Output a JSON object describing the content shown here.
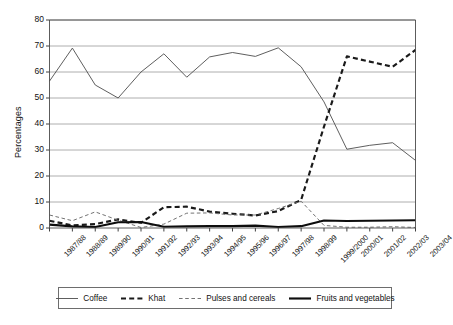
{
  "chart": {
    "type": "line",
    "ylabel": "Percentages",
    "xlabel": ""
  },
  "axis": {
    "yticks": [
      "0",
      "10",
      "20",
      "30",
      "40",
      "50",
      "60",
      "70",
      "80"
    ],
    "ymin": 0,
    "ymax": 80,
    "ystep": 10
  },
  "legend": {
    "items": [
      {
        "label": "Coffee",
        "style": "thin-solid"
      },
      {
        "label": "Khat",
        "style": "thick-dashed"
      },
      {
        "label": "Pulses and cereals",
        "style": "thin-dashed"
      },
      {
        "label": "Fruits and vegetables",
        "style": "thick-solid"
      }
    ]
  },
  "chart_data": {
    "type": "line",
    "title": "",
    "xlabel": "",
    "ylabel": "Percentages",
    "ylim": [
      0,
      80
    ],
    "yticks": [
      0,
      10,
      20,
      30,
      40,
      50,
      60,
      70,
      80
    ],
    "grid": true,
    "legend_position": "bottom",
    "categories": [
      "1987/88",
      "1988/89",
      "1989/90",
      "1990/91",
      "1991/92",
      "1992/93",
      "1993/94",
      "1994/95",
      "1995/96",
      "1996/97",
      "1997/98",
      "1998/99",
      "1999/2000",
      "2000/01",
      "2001/02",
      "2002/03",
      "2003/04"
    ],
    "series": [
      {
        "name": "Coffee",
        "style": "thin-solid",
        "color": "#555555",
        "values": [
          56.5,
          69.2,
          55.0,
          50.0,
          60.0,
          67.0,
          58.0,
          65.8,
          67.5,
          66.0,
          69.3,
          62.0,
          48.5,
          30.3,
          31.8,
          32.8,
          26.0
        ]
      },
      {
        "name": "Khat",
        "style": "thick-dashed",
        "color": "#1a1a1a",
        "values": [
          2.8,
          1.0,
          1.5,
          3.3,
          2.0,
          8.0,
          8.2,
          6.3,
          5.5,
          4.8,
          6.5,
          10.8,
          39.0,
          66.0,
          64.0,
          62.0,
          68.5
        ]
      },
      {
        "name": "Pulses and cereals",
        "style": "thin-dashed",
        "color": "#6b6b6b",
        "values": [
          5.0,
          2.8,
          6.2,
          3.0,
          0.2,
          1.5,
          5.7,
          5.8,
          5.0,
          5.0,
          7.5,
          10.3,
          1.0,
          0.3,
          0.3,
          0.5,
          0.2
        ]
      },
      {
        "name": "Fruits and vegetables",
        "style": "thick-solid",
        "color": "#0d0d0d",
        "values": [
          1.3,
          0.6,
          0.4,
          2.2,
          2.3,
          0.5,
          0.6,
          0.7,
          0.7,
          0.9,
          0.4,
          0.7,
          2.9,
          2.7,
          2.8,
          2.9,
          3.0
        ]
      }
    ]
  }
}
